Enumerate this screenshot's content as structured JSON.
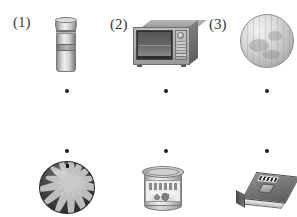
{
  "worksheet": {
    "type": "matching-exercise",
    "background_color": "#ffffff",
    "row_top": {
      "items": [
        {
          "label": "(1)",
          "object": "bottle-thermos",
          "object_description": "grey cylindrical bottle with cap and label band",
          "connector_dot": {
            "x": 67,
            "y": 91
          }
        },
        {
          "label": "(2)",
          "object": "microwave-oven",
          "object_description": "grey microwave oven with dark glass door and control panel",
          "connector_dot": {
            "x": 166,
            "y": 91
          }
        },
        {
          "label": "(3)",
          "object": "globe-sphere",
          "object_description": "light grey sphere resembling a globe ball",
          "connector_dot": {
            "x": 267,
            "y": 91
          }
        }
      ]
    },
    "row_bottom": {
      "items": [
        {
          "label": "",
          "object": "watermelon",
          "object_description": "dark striped watermelon",
          "connector_dot": {
            "x": 67,
            "y": 151
          }
        },
        {
          "label": "",
          "object": "tin-can",
          "object_description": "metal tin can with printed paper label",
          "connector_dot": {
            "x": 166,
            "y": 151
          }
        },
        {
          "label": "",
          "object": "book",
          "object_description": "closed hardcover book lying at an angle",
          "connector_dot": {
            "x": 267,
            "y": 151
          }
        }
      ]
    },
    "colors": {
      "dot": "#1b1b1b",
      "label_text": "#3a3a3a",
      "paper": "#ffffff"
    }
  }
}
